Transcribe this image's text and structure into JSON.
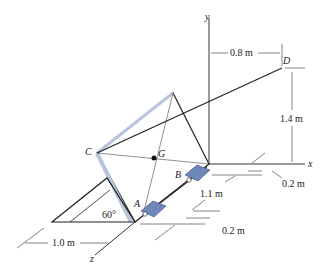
{
  "diagram": {
    "axes": {
      "x": "x",
      "y": "y",
      "z": "z"
    },
    "points": {
      "A": "A",
      "B": "B",
      "C": "C",
      "D": "D",
      "G": "G"
    },
    "dimensions": {
      "top_horizontal": "0.8 m",
      "vertical_right": "1.4 m",
      "right_offset": "0.2 m",
      "bearing_spacing": "1.1 m",
      "bottom_offset": "0.2 m",
      "base_length": "1.0 m",
      "angle": "60°"
    },
    "colors": {
      "bearing": "#6f86b8",
      "frame_edge": "#b8c4dc",
      "line": "#222222"
    }
  }
}
